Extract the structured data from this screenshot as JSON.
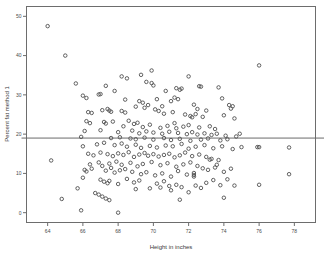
{
  "figure": {
    "name": "percent-fat-vs-height-scatter",
    "background_color": "#ffffff",
    "frame_color": "#6d6d6d",
    "marker_color": "#4f4f4f",
    "reference_line_color": "#6a6a6a"
  },
  "chart_data": {
    "type": "scatter",
    "title": "",
    "xlabel": "Height in inches",
    "ylabel": "Percent fat method 1",
    "xlim": [
      62.8,
      79.2
    ],
    "ylim": [
      -2.5,
      52.5
    ],
    "xticks": [
      64,
      66,
      68,
      70,
      72,
      74,
      76,
      78
    ],
    "xtick_labels": [
      "64",
      "66",
      "68",
      "70",
      "72",
      "74",
      "76",
      "78"
    ],
    "yticks": [
      0,
      10,
      20,
      30,
      40,
      50
    ],
    "ytick_labels": [
      "0",
      "10",
      "20",
      "30",
      "40",
      "50"
    ],
    "grid": false,
    "legend": false,
    "marker": "open-circle",
    "marker_size": 4,
    "reference_lines": [
      {
        "orientation": "horizontal",
        "value": 19.0,
        "label": ""
      }
    ],
    "series": [
      {
        "name": "Percent fat method 1",
        "points": [
          [
            64.0,
            47.5
          ],
          [
            65.0,
            40.0
          ],
          [
            65.6,
            32.9
          ],
          [
            66.0,
            29.8
          ],
          [
            66.2,
            29.2
          ],
          [
            67.3,
            32.3
          ],
          [
            67.0,
            30.2
          ],
          [
            68.2,
            34.7
          ],
          [
            68.5,
            34.2
          ],
          [
            69.3,
            35.1
          ],
          [
            69.9,
            36.2
          ],
          [
            69.6,
            33.3
          ],
          [
            69.9,
            33.0
          ],
          [
            70.0,
            32.4
          ],
          [
            70.7,
            31.0
          ],
          [
            71.3,
            31.7
          ],
          [
            71.5,
            31.3
          ],
          [
            71.6,
            31.6
          ],
          [
            72.0,
            34.7
          ],
          [
            72.6,
            32.2
          ],
          [
            72.7,
            32.1
          ],
          [
            73.7,
            31.9
          ],
          [
            76.0,
            37.5
          ],
          [
            67.8,
            31.0
          ],
          [
            66.9,
            30.1
          ],
          [
            68.4,
            28.8
          ],
          [
            69.2,
            28.4
          ],
          [
            69.4,
            28.0
          ],
          [
            70.2,
            28.9
          ],
          [
            70.5,
            27.1
          ],
          [
            71.0,
            28.4
          ],
          [
            71.2,
            29.3
          ],
          [
            71.4,
            28.9
          ],
          [
            72.3,
            27.5
          ],
          [
            72.5,
            26.4
          ],
          [
            73.0,
            26.0
          ],
          [
            73.9,
            29.1
          ],
          [
            74.3,
            27.4
          ],
          [
            74.5,
            27.1
          ],
          [
            74.4,
            26.5
          ],
          [
            66.3,
            25.6
          ],
          [
            66.5,
            25.4
          ],
          [
            67.1,
            26.1
          ],
          [
            67.4,
            26.4
          ],
          [
            67.5,
            26.0
          ],
          [
            67.6,
            25.7
          ],
          [
            68.2,
            25.9
          ],
          [
            68.4,
            25.5
          ],
          [
            69.0,
            27.0
          ],
          [
            69.5,
            26.7
          ],
          [
            69.7,
            27.4
          ],
          [
            70.1,
            26.3
          ],
          [
            70.3,
            25.9
          ],
          [
            70.6,
            25.2
          ],
          [
            71.1,
            25.6
          ],
          [
            71.8,
            25.0
          ],
          [
            72.1,
            24.6
          ],
          [
            72.2,
            24.3
          ],
          [
            72.4,
            25.1
          ],
          [
            72.8,
            24.4
          ],
          [
            74.0,
            24.8
          ],
          [
            74.6,
            24.0
          ],
          [
            66.2,
            23.3
          ],
          [
            66.4,
            22.8
          ],
          [
            67.2,
            23.1
          ],
          [
            67.3,
            22.7
          ],
          [
            67.7,
            23.2
          ],
          [
            68.3,
            22.0
          ],
          [
            68.6,
            23.4
          ],
          [
            68.9,
            22.6
          ],
          [
            69.1,
            22.9
          ],
          [
            69.4,
            21.8
          ],
          [
            69.8,
            22.4
          ],
          [
            70.4,
            21.6
          ],
          [
            70.8,
            22.1
          ],
          [
            71.2,
            22.8
          ],
          [
            71.3,
            21.5
          ],
          [
            71.7,
            21.9
          ],
          [
            72.0,
            22.3
          ],
          [
            72.6,
            21.7
          ],
          [
            73.2,
            22.0
          ],
          [
            73.5,
            21.3
          ],
          [
            66.1,
            20.8
          ],
          [
            67.0,
            21.0
          ],
          [
            68.0,
            20.5
          ],
          [
            68.8,
            20.9
          ],
          [
            69.2,
            20.2
          ],
          [
            69.6,
            20.7
          ],
          [
            70.0,
            20.4
          ],
          [
            70.5,
            20.1
          ],
          [
            70.9,
            20.6
          ],
          [
            71.4,
            20.3
          ],
          [
            71.9,
            20.0
          ],
          [
            72.2,
            20.5
          ],
          [
            72.5,
            19.9
          ],
          [
            72.9,
            20.2
          ],
          [
            73.3,
            19.8
          ],
          [
            73.6,
            20.1
          ],
          [
            74.1,
            19.6
          ],
          [
            74.7,
            19.4
          ],
          [
            65.9,
            19.3
          ],
          [
            67.6,
            19.0
          ],
          [
            68.1,
            19.2
          ],
          [
            68.7,
            18.9
          ],
          [
            69.0,
            18.7
          ],
          [
            69.5,
            19.1
          ],
          [
            70.0,
            18.6
          ],
          [
            70.6,
            19.0
          ],
          [
            71.0,
            18.5
          ],
          [
            71.5,
            18.8
          ],
          [
            72.1,
            18.3
          ],
          [
            72.7,
            18.6
          ],
          [
            73.1,
            18.9
          ],
          [
            73.8,
            18.4
          ],
          [
            74.2,
            18.7
          ],
          [
            74.9,
            20.1
          ],
          [
            66.0,
            16.9
          ],
          [
            66.8,
            17.4
          ],
          [
            67.2,
            17.8
          ],
          [
            67.8,
            17.2
          ],
          [
            68.2,
            17.6
          ],
          [
            68.5,
            16.8
          ],
          [
            69.0,
            17.3
          ],
          [
            69.3,
            16.5
          ],
          [
            69.8,
            17.0
          ],
          [
            70.2,
            16.6
          ],
          [
            70.7,
            17.1
          ],
          [
            71.1,
            16.9
          ],
          [
            71.6,
            17.5
          ],
          [
            72.0,
            16.3
          ],
          [
            72.4,
            16.8
          ],
          [
            72.9,
            17.2
          ],
          [
            73.4,
            16.4
          ],
          [
            73.9,
            16.9
          ],
          [
            74.5,
            16.2
          ],
          [
            75.0,
            16.7
          ],
          [
            75.9,
            16.7
          ],
          [
            76.0,
            16.7
          ],
          [
            77.7,
            16.6
          ],
          [
            64.2,
            13.3
          ],
          [
            66.3,
            15.0
          ],
          [
            66.6,
            14.6
          ],
          [
            67.0,
            15.3
          ],
          [
            67.4,
            14.9
          ],
          [
            67.7,
            14.4
          ],
          [
            68.0,
            15.1
          ],
          [
            68.3,
            14.7
          ],
          [
            68.6,
            15.4
          ],
          [
            68.9,
            14.2
          ],
          [
            69.2,
            14.8
          ],
          [
            69.5,
            15.2
          ],
          [
            69.7,
            14.5
          ],
          [
            70.0,
            14.9
          ],
          [
            70.3,
            14.3
          ],
          [
            70.6,
            14.7
          ],
          [
            70.9,
            15.0
          ],
          [
            71.2,
            14.1
          ],
          [
            71.5,
            14.6
          ],
          [
            71.8,
            15.3
          ],
          [
            72.2,
            14.4
          ],
          [
            72.6,
            14.8
          ],
          [
            73.0,
            14.2
          ],
          [
            73.3,
            13.7
          ],
          [
            73.7,
            13.4
          ],
          [
            66.4,
            12.3
          ],
          [
            66.9,
            12.8
          ],
          [
            67.1,
            11.9
          ],
          [
            67.5,
            12.5
          ],
          [
            67.9,
            13.0
          ],
          [
            68.2,
            12.2
          ],
          [
            68.7,
            12.7
          ],
          [
            69.1,
            11.8
          ],
          [
            69.4,
            12.4
          ],
          [
            69.9,
            12.9
          ],
          [
            70.4,
            12.1
          ],
          [
            70.8,
            12.6
          ],
          [
            71.3,
            11.7
          ],
          [
            71.7,
            12.3
          ],
          [
            72.1,
            12.8
          ],
          [
            72.5,
            11.9
          ],
          [
            73.2,
            13.5
          ],
          [
            73.6,
            12.2
          ],
          [
            66.1,
            10.9
          ],
          [
            66.2,
            10.5
          ],
          [
            66.5,
            11.2
          ],
          [
            67.3,
            10.7
          ],
          [
            67.6,
            11.4
          ],
          [
            67.8,
            10.2
          ],
          [
            68.1,
            10.8
          ],
          [
            68.4,
            11.1
          ],
          [
            68.8,
            10.4
          ],
          [
            69.3,
            9.8
          ],
          [
            69.6,
            10.3
          ],
          [
            70.1,
            9.5
          ],
          [
            70.5,
            10.0
          ],
          [
            71.0,
            9.2
          ],
          [
            71.4,
            10.6
          ],
          [
            71.9,
            9.7
          ],
          [
            72.3,
            10.1
          ],
          [
            72.3,
            9.6
          ],
          [
            72.3,
            9.2
          ],
          [
            72.8,
            11.3
          ],
          [
            73.1,
            10.9
          ],
          [
            73.5,
            11.5
          ],
          [
            74.0,
            10.4
          ],
          [
            74.4,
            11.2
          ],
          [
            77.7,
            9.8
          ],
          [
            66.0,
            8.9
          ],
          [
            67.0,
            8.4
          ],
          [
            67.2,
            7.9
          ],
          [
            67.4,
            7.5
          ],
          [
            67.5,
            8.1
          ],
          [
            68.0,
            7.3
          ],
          [
            68.5,
            8.6
          ],
          [
            68.9,
            7.7
          ],
          [
            69.2,
            8.2
          ],
          [
            69.8,
            6.2
          ],
          [
            70.2,
            7.4
          ],
          [
            70.6,
            8.0
          ],
          [
            70.9,
            6.8
          ],
          [
            71.3,
            7.1
          ],
          [
            71.6,
            6.5
          ],
          [
            72.0,
            5.2
          ],
          [
            72.4,
            6.9
          ],
          [
            72.7,
            6.3
          ],
          [
            73.0,
            7.6
          ],
          [
            73.4,
            8.3
          ],
          [
            73.8,
            7.0
          ],
          [
            74.2,
            8.5
          ],
          [
            74.6,
            6.9
          ],
          [
            76.0,
            7.1
          ],
          [
            65.7,
            6.2
          ],
          [
            66.7,
            5.0
          ],
          [
            66.9,
            4.6
          ],
          [
            67.1,
            4.1
          ],
          [
            67.3,
            3.6
          ],
          [
            67.5,
            3.2
          ],
          [
            71.5,
            3.3
          ],
          [
            74.0,
            3.8
          ],
          [
            64.8,
            3.5
          ],
          [
            65.9,
            0.6
          ],
          [
            68.0,
            0.0
          ],
          [
            69.0,
            6.0
          ],
          [
            70.4,
            6.4
          ],
          [
            71.0,
            5.7
          ]
        ]
      }
    ]
  }
}
